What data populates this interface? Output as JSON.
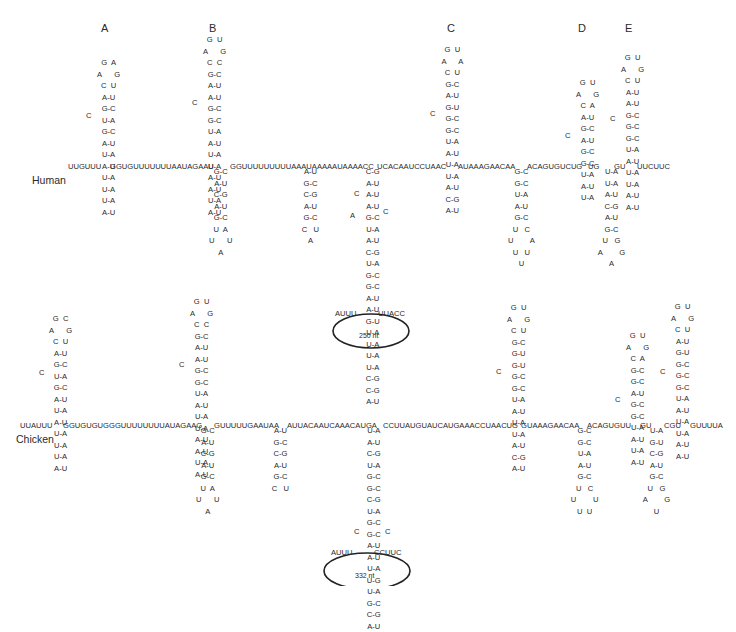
{
  "stem_labels": [
    {
      "id": "A",
      "x": 101,
      "y": 22
    },
    {
      "id": "B",
      "x": 209,
      "y": 22
    },
    {
      "id": "C",
      "x": 447,
      "y": 22
    },
    {
      "id": "D",
      "x": 578,
      "y": 22
    },
    {
      "id": "E",
      "x": 625,
      "y": 22
    }
  ],
  "species": [
    {
      "name": "Human",
      "x": 32,
      "y": 174
    },
    {
      "name": "Chicken",
      "x": 16,
      "y": 433
    }
  ],
  "human": {
    "backbone": [
      {
        "text": "UUGUUU",
        "x": 68,
        "y": 161
      },
      {
        "text": "GGUGUUUUUUUAAUAGAAU",
        "x": 110,
        "y": 161
      },
      {
        "text": "GGUUUUUUUUUAAAUAAA",
        "x": 230,
        "y": 161
      },
      {
        "text": "AAUAAAACC",
        "x": 327,
        "y": 161
      },
      {
        "text": "UCACAAUCCUAAC",
        "x": 377,
        "y": 161
      },
      {
        "text": "AUAAAGAACAA",
        "x": 458,
        "y": 161
      },
      {
        "text": "ACAGUGUCUG",
        "x": 527,
        "y": 161
      },
      {
        "text": "UG",
        "x": 588,
        "y": 161
      },
      {
        "text": "GU",
        "x": 614,
        "y": 161
      },
      {
        "text": "UUCUUC",
        "x": 637,
        "y": 161
      }
    ],
    "stems": [
      {
        "name": "stem-A",
        "x": 104,
        "y": 57,
        "dir": "up",
        "loop": [
          "G  A",
          "A      G",
          "C  U"
        ],
        "pairs": [
          "A-U",
          "G-C",
          "U-A",
          "G-C",
          "A-U",
          "U-A",
          "A-U",
          "U-A",
          "U-A",
          "U-A",
          "A-U"
        ],
        "bulges": [
          {
            "text": "C",
            "x": 86,
            "y": 110
          }
        ]
      },
      {
        "name": "stem-B",
        "x": 210,
        "y": 34,
        "dir": "up",
        "loop": [
          "G  U",
          "A      G",
          "C  C"
        ],
        "pairs": [
          "G-C",
          "A-U",
          "A-U",
          "G-C",
          "G-C",
          "U-A",
          "A-U",
          "U-A",
          "U-A",
          "A-U",
          "A-U",
          "U-A",
          "A-U"
        ],
        "bulges": [
          {
            "text": "C",
            "x": 192,
            "y": 97
          }
        ]
      },
      {
        "name": "stem-B-down",
        "x": 216,
        "y": 166,
        "dir": "down",
        "pairs": [
          "G-C",
          "A-U",
          "C-G",
          "A-U",
          "G-C"
        ],
        "loop": [
          "U  A",
          "U      U",
          "A"
        ]
      },
      {
        "name": "stem-ac-down",
        "x": 307,
        "y": 166,
        "dir": "down",
        "pairs": [
          "A-U",
          "G-C",
          "C-G",
          "A-U",
          "G-C"
        ],
        "loop": [
          "C   U",
          "A"
        ]
      },
      {
        "name": "stem-long-down",
        "x": 370,
        "y": 166,
        "dir": "down",
        "pairs": [
          "C-G",
          "A-U",
          "A-U",
          "A-U",
          "G-C",
          "U-A",
          "A-U",
          "C-G",
          "U-A",
          "G-C",
          "G-C",
          "A-U",
          "A-U",
          "G-U",
          "U-A",
          "U-A",
          "U-A",
          "U-A",
          "C-G",
          "C-G",
          "A-U"
        ],
        "bulges": [
          {
            "text": "C",
            "x": 354,
            "y": 188
          },
          {
            "text": "A",
            "x": 350,
            "y": 210
          },
          {
            "text": "C",
            "x": 383,
            "y": 206
          }
        ]
      },
      {
        "name": "stem-C",
        "x": 448,
        "y": 44,
        "dir": "up",
        "loop": [
          "G  U",
          "A      A",
          "C  U"
        ],
        "pairs": [
          "G-C",
          "A-U",
          "G-U",
          "G-C",
          "G-C",
          "U-A",
          "A-U",
          "U-A",
          "U-A",
          "A-U",
          "C-G",
          "A-U"
        ],
        "bulges": [
          {
            "text": "C",
            "x": 430,
            "y": 108
          }
        ]
      },
      {
        "name": "stem-C-down",
        "x": 516,
        "y": 166,
        "dir": "down",
        "pairs": [
          "G-C",
          "G-C",
          "U-A",
          "A-U",
          "G-C"
        ],
        "loop": [
          "U   C",
          "U        A",
          "U   U",
          "U"
        ]
      },
      {
        "name": "stem-D",
        "x": 583,
        "y": 77,
        "dir": "up",
        "loop": [
          "G  U",
          "A      G",
          "C  A"
        ],
        "pairs": [
          "A-U",
          "G-C",
          "A-U",
          "G-C",
          "G-C",
          "U-A",
          "A-U",
          "U-A"
        ],
        "bulges": [
          {
            "text": "C",
            "x": 565,
            "y": 130
          }
        ]
      },
      {
        "name": "stem-D-down",
        "x": 606,
        "y": 166,
        "dir": "down",
        "pairs": [
          "U-A",
          "U-A",
          "A-U",
          "C-G",
          "A-U",
          "G-C"
        ],
        "loop": [
          "U   G",
          "A        G",
          "A"
        ]
      },
      {
        "name": "stem-E",
        "x": 628,
        "y": 52,
        "dir": "up",
        "loop": [
          "G  U",
          "A      G",
          "C  U"
        ],
        "pairs": [
          "A-U",
          "A-U",
          "G-C",
          "G-C",
          "G-C",
          "U-A",
          "A-U",
          "U-A",
          "U-A",
          "A-U",
          "A-U"
        ],
        "bulges": [
          {
            "text": "C",
            "x": 610,
            "y": 113
          }
        ]
      }
    ],
    "loop_ellipse": {
      "cx": 371,
      "cy": 331,
      "rx": 38,
      "ry": 17,
      "left_seq": "AUUU",
      "right_seq": "UUACC",
      "note": "250 nt"
    }
  },
  "chicken": {
    "backbone": [
      {
        "text": "UUAUUU",
        "x": 20,
        "y": 420
      },
      {
        "text": "GGUGUGUGGGUUUUUUUUAUAGAAG",
        "x": 63,
        "y": 420
      },
      {
        "text": "GUUUUUGAAUAA",
        "x": 214,
        "y": 420
      },
      {
        "text": "AUUACAAUCAAACAUGA",
        "x": 287,
        "y": 420
      },
      {
        "text": "CCUUAUGUAUCAUGAAACCUAACUG",
        "x": 383,
        "y": 420
      },
      {
        "text": "GUAAAGAACAA",
        "x": 521,
        "y": 420
      },
      {
        "text": "ACAGUGUU",
        "x": 587,
        "y": 420
      },
      {
        "text": "GU",
        "x": 640,
        "y": 420
      },
      {
        "text": "CGU",
        "x": 664,
        "y": 420
      },
      {
        "text": "GUUUUA",
        "x": 690,
        "y": 420
      }
    ],
    "stems": [
      {
        "name": "stem-A",
        "x": 56,
        "y": 313,
        "dir": "up",
        "loop": [
          "G  C",
          "A      G",
          "C  U"
        ],
        "pairs": [
          "A-U",
          "G-C",
          "U-A",
          "G-C",
          "A-U",
          "U-A",
          "A-U",
          "U-A",
          "U-A",
          "U-A",
          "A-U"
        ],
        "bulges": [
          {
            "text": "C",
            "x": 39,
            "y": 367
          }
        ]
      },
      {
        "name": "stem-B",
        "x": 197,
        "y": 296,
        "dir": "up",
        "loop": [
          "G  U",
          "A      G",
          "C  C"
        ],
        "pairs": [
          "G-C",
          "A-U",
          "A-U",
          "G-C",
          "G-C",
          "U-A",
          "A-U",
          "U-A",
          "U-A",
          "A-U",
          "A-U",
          "U-A",
          "A-U"
        ],
        "bulges": [
          {
            "text": "C",
            "x": 179,
            "y": 359
          }
        ]
      },
      {
        "name": "stem-B-down",
        "x": 203,
        "y": 425,
        "dir": "down",
        "pairs": [
          "G-C",
          "A-U",
          "C-G",
          "A-U",
          "G-C"
        ],
        "loop": [
          "U  A",
          "U      U",
          "A"
        ]
      },
      {
        "name": "stem-ac-down",
        "x": 277,
        "y": 425,
        "dir": "down",
        "pairs": [
          "A-U",
          "G-C",
          "C-G",
          "A-U",
          "G-C"
        ],
        "loop": [
          "C   U"
        ]
      },
      {
        "name": "stem-long-down",
        "x": 371,
        "y": 425,
        "dir": "down",
        "pairs": [
          "U-A",
          "A-U",
          "C-G",
          "U-A",
          "G-C",
          "G-C",
          "C-G",
          "U-A",
          "G-C",
          "G-C",
          "A-U",
          "A-U",
          "U-A",
          "U-G",
          "U-A",
          "G-C",
          "C-G",
          "A-U"
        ],
        "bulges": [
          {
            "text": "C",
            "x": 354,
            "y": 526
          },
          {
            "text": "C",
            "x": 385,
            "y": 526
          }
        ]
      },
      {
        "name": "stem-C",
        "x": 514,
        "y": 302,
        "dir": "up",
        "loop": [
          "G  U",
          "A      G",
          "C  U"
        ],
        "pairs": [
          "G-C",
          "G-U",
          "G-U",
          "G-C",
          "G-C",
          "U-A",
          "A-U",
          "U-A",
          "U-A",
          "A-U",
          "C-G",
          "A-U"
        ],
        "bulges": [
          {
            "text": "C",
            "x": 496,
            "y": 366
          }
        ]
      },
      {
        "name": "stem-C-down",
        "x": 579,
        "y": 425,
        "dir": "down",
        "pairs": [
          "G-C",
          "G-C",
          "U-A",
          "A-U",
          "G-C"
        ],
        "loop": [
          "U   C",
          "U        U",
          "U  U"
        ]
      },
      {
        "name": "stem-D",
        "x": 633,
        "y": 330,
        "dir": "up",
        "loop": [
          "G  U",
          "A      G",
          "C  A"
        ],
        "pairs": [
          "G-C",
          "G-C",
          "A-U",
          "G-C",
          "G-C",
          "U-A",
          "A-U",
          "U-A",
          "A-U"
        ],
        "bulges": [
          {
            "text": "C",
            "x": 615,
            "y": 394
          }
        ]
      },
      {
        "name": "stem-D-down",
        "x": 651,
        "y": 425,
        "dir": "down",
        "pairs": [
          "U-A",
          "G-U",
          "C-G",
          "A-U",
          "G-C"
        ],
        "loop": [
          "U   G",
          "A        G",
          "U"
        ]
      },
      {
        "name": "stem-E",
        "x": 678,
        "y": 301,
        "dir": "up",
        "loop": [
          "G  U",
          "A      G",
          "C  U"
        ],
        "pairs": [
          "A-U",
          "G-U",
          "G-C",
          "G-C",
          "G-C",
          "U-A",
          "A-U",
          "U-A",
          "U-A",
          "A-U",
          "A-U"
        ],
        "bulges": [
          {
            "text": "C",
            "x": 660,
            "y": 366
          }
        ]
      }
    ],
    "loop_ellipse": {
      "cx": 367,
      "cy": 571,
      "rx": 43,
      "ry": 18,
      "left_seq": "AUUU",
      "right_seq": "CCUUC",
      "note": "332 nt"
    }
  }
}
